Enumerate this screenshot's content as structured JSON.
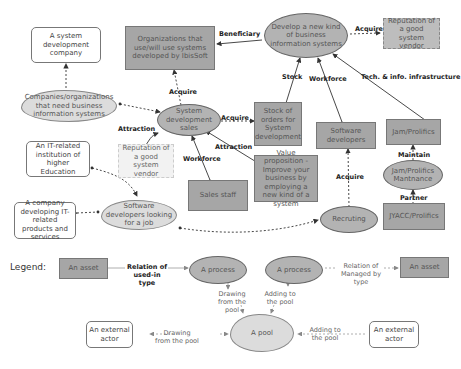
{
  "nodes": {
    "system_dev_company": "A system development company",
    "orgs_using": "Organizations that use/will use systems developed by IbisSoft",
    "develop_new": "Develop a new kind of business information systems",
    "reputation_top": "Reputation of a good system vendor",
    "companies_need": "Companies/organizations that need business information systems",
    "system_dev_sales": "System development sales",
    "stock_orders": "Stock of orders for System development",
    "software_devs": "Software developers",
    "jam_prolifics": "Jam/Prolifics",
    "reputation_mid": "Reputation of a good system vendor",
    "it_institution": "An IT-related institution of higher Education",
    "value_prop": "Value proposition - Improve your business by employing a new kind of a system",
    "jam_maint": "Jam/Prolifics Mantnance",
    "sales_staff": "Sales staff",
    "it_company": "A company developing IT-related products and services",
    "devs_looking": "Software developers looking for a job",
    "recruting": "Recruting",
    "jyacc": "JYACC/Prolifics"
  },
  "edges": {
    "beneficiary": "Beneficiary",
    "acquire_top": "Acquire",
    "acquire_orgs": "Acquire",
    "stock": "Stock",
    "workforce_top": "Workforce",
    "tech_info": "Tech. & info. infrastructure",
    "attraction_left": "Attraction",
    "acquire_stock": "Acquire",
    "attraction_right": "Attraction",
    "workforce_sales": "Workforce",
    "maintain": "Maintain",
    "acquire_devs": "Acquire",
    "partner": "Partner"
  },
  "legend": {
    "title": "Legend:",
    "asset1": "An asset",
    "used_in": "Relation of used-in type",
    "process1": "A process",
    "process2": "A process",
    "managed_by": "Relation of Managed by type",
    "asset2": "An asset",
    "drawing_from_pool1": "Drawing from the pool",
    "adding_to_pool1": "Adding to the pool",
    "actor1": "An external actor",
    "drawing_from_pool2": "Drawing from the pool",
    "pool": "A pool",
    "adding_to_pool2": "Adding to the pool",
    "actor2": "An external actor"
  }
}
